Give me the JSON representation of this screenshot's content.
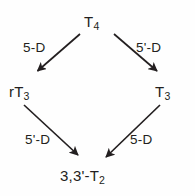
{
  "diagram": {
    "background_color": "#fefefe",
    "ink_color": "#231f20",
    "nodes": [
      {
        "id": "t4",
        "base": "T",
        "subscript": "4",
        "label": "T4"
      },
      {
        "id": "rt3",
        "base": "rT",
        "subscript": "3",
        "label": "rT3"
      },
      {
        "id": "t3",
        "base": "T",
        "subscript": "3",
        "label": "T3"
      },
      {
        "id": "t2",
        "base": "3,3'-T",
        "subscript": "2",
        "label": "3,3'-T2"
      }
    ],
    "edges": [
      {
        "id": "t4-rt3",
        "from": "t4",
        "to": "rt3",
        "label": "5-D"
      },
      {
        "id": "t4-t3",
        "from": "t4",
        "to": "t3",
        "label": "5'-D"
      },
      {
        "id": "rt3-t2",
        "from": "rt3",
        "to": "t2",
        "label": "5'-D"
      },
      {
        "id": "t3-t2",
        "from": "t3",
        "to": "t2",
        "label": "5-D"
      }
    ]
  }
}
